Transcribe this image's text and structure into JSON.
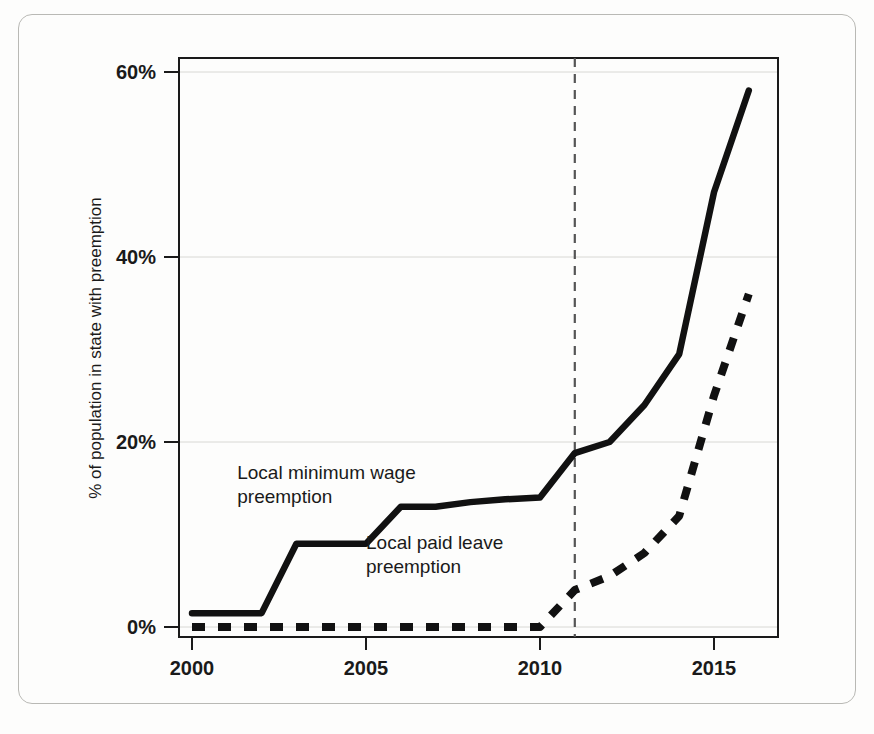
{
  "chart_data": {
    "type": "line",
    "title": "",
    "xlabel": "",
    "ylabel": "% of population in state with preemption",
    "xlim": [
      2000,
      2016.3
    ],
    "ylim": [
      0,
      62
    ],
    "grid": true,
    "legend_position": "inline-annotations",
    "x_ticks": [
      "2000",
      "2005",
      "2010",
      "2015"
    ],
    "x_tick_values": [
      2000,
      2005,
      2010,
      2015
    ],
    "y_ticks": [
      "0%",
      "20%",
      "40%",
      "60%"
    ],
    "y_tick_values": [
      0,
      20,
      40,
      60
    ],
    "x": [
      2000,
      2001,
      2002,
      2003,
      2004,
      2005,
      2006,
      2007,
      2008,
      2009,
      2010,
      2011,
      2012,
      2013,
      2014,
      2015,
      2016
    ],
    "series": [
      {
        "name": "Local minimum wage preemption",
        "style": "solid",
        "color": "#111111",
        "values": [
          1.5,
          1.5,
          1.5,
          9.0,
          9.0,
          9.0,
          13.0,
          13.0,
          13.5,
          13.8,
          14.0,
          18.8,
          20.0,
          24.0,
          29.5,
          47.0,
          58.0
        ]
      },
      {
        "name": "Local paid leave preemption",
        "style": "dashed",
        "color": "#111111",
        "values": [
          0.0,
          0.0,
          0.0,
          0.0,
          0.0,
          0.0,
          0.0,
          0.0,
          0.0,
          0.0,
          0.0,
          4.0,
          5.5,
          8.0,
          12.0,
          25.0,
          36.0
        ]
      }
    ],
    "annotations": [
      {
        "text_line1": "Local minimum wage",
        "text_line2": "preemption",
        "x": 2001.3,
        "y": 16.0
      },
      {
        "text_line1": "Local paid leave",
        "text_line2": "preemption",
        "x": 2005.0,
        "y": 8.4
      }
    ],
    "reference_lines": [
      {
        "orientation": "vertical",
        "value": 2011,
        "style": "dashed",
        "color": "#555555"
      }
    ]
  },
  "axis": {
    "y_title": "% of population in state with preemption"
  }
}
